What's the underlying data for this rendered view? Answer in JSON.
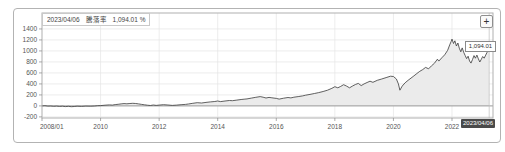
{
  "chart": {
    "tooltip": {
      "date": "2023/04/06",
      "metric_label": "騰落率",
      "value": "1,094.01 %"
    },
    "zoom_button_label": "+",
    "last_value_label": "1,094.01",
    "crosshair_date_label": "2023/04/06",
    "colors": {
      "line": "#3a3a3a",
      "area_fill": "#ebebeb",
      "grid": "#e4e4e4",
      "plot_border": "#b0b0b0",
      "zero_line": "#999999",
      "tick": "#888888",
      "axis_text": "#555555",
      "crosshair_line": "#c0c0c0",
      "crosshair_bg": "#4a4a4a"
    }
  },
  "chart_data": {
    "type": "area",
    "title": "",
    "xlabel": "",
    "ylabel": "",
    "legend": "none",
    "grid": "on",
    "xlim": [
      2008.0,
      2023.4
    ],
    "ylim": [
      -220,
      1690
    ],
    "x_ticks": [
      {
        "x": 2008.0,
        "label": "2008/01"
      },
      {
        "x": 2010,
        "label": "2010"
      },
      {
        "x": 2012,
        "label": "2012"
      },
      {
        "x": 2014,
        "label": "2014"
      },
      {
        "x": 2016,
        "label": "2016"
      },
      {
        "x": 2018,
        "label": "2018"
      },
      {
        "x": 2020,
        "label": "2020"
      },
      {
        "x": 2022,
        "label": "2022"
      }
    ],
    "y_ticks": [
      {
        "v": 1400,
        "label": "1400"
      },
      {
        "v": 1200,
        "label": "1200"
      },
      {
        "v": 1000,
        "label": "1000"
      },
      {
        "v": 800,
        "label": "800"
      },
      {
        "v": 600,
        "label": "600"
      },
      {
        "v": 400,
        "label": "400"
      },
      {
        "v": 200,
        "label": "200"
      },
      {
        "v": 0,
        "label": "0"
      },
      {
        "v": -200,
        "label": "-200"
      }
    ],
    "series": [
      {
        "name": "騰落率 (%)",
        "last_point": {
          "date": "2023/04/06",
          "value": 1094.01
        },
        "points": [
          [
            2008.0,
            0
          ],
          [
            2008.1,
            3
          ],
          [
            2008.2,
            -4
          ],
          [
            2008.3,
            -2
          ],
          [
            2008.4,
            -7
          ],
          [
            2008.5,
            -4
          ],
          [
            2008.6,
            -9
          ],
          [
            2008.7,
            -6
          ],
          [
            2008.8,
            -12
          ],
          [
            2008.9,
            -8
          ],
          [
            2009.0,
            -14
          ],
          [
            2009.1,
            -10
          ],
          [
            2009.2,
            -6
          ],
          [
            2009.35,
            -9
          ],
          [
            2009.5,
            -3
          ],
          [
            2009.65,
            -6
          ],
          [
            2009.8,
            -1
          ],
          [
            2009.9,
            3
          ],
          [
            2010.0,
            6
          ],
          [
            2010.15,
            12
          ],
          [
            2010.3,
            18
          ],
          [
            2010.4,
            14
          ],
          [
            2010.5,
            24
          ],
          [
            2010.6,
            30
          ],
          [
            2010.7,
            36
          ],
          [
            2010.8,
            42
          ],
          [
            2010.9,
            38
          ],
          [
            2011.0,
            44
          ],
          [
            2011.1,
            48
          ],
          [
            2011.2,
            43
          ],
          [
            2011.3,
            36
          ],
          [
            2011.4,
            28
          ],
          [
            2011.5,
            20
          ],
          [
            2011.6,
            12
          ],
          [
            2011.7,
            8
          ],
          [
            2011.8,
            16
          ],
          [
            2011.9,
            10
          ],
          [
            2012.0,
            14
          ],
          [
            2012.15,
            22
          ],
          [
            2012.3,
            16
          ],
          [
            2012.45,
            10
          ],
          [
            2012.6,
            15
          ],
          [
            2012.75,
            22
          ],
          [
            2012.9,
            28
          ],
          [
            2013.0,
            35
          ],
          [
            2013.15,
            48
          ],
          [
            2013.3,
            58
          ],
          [
            2013.45,
            52
          ],
          [
            2013.6,
            64
          ],
          [
            2013.75,
            72
          ],
          [
            2013.9,
            80
          ],
          [
            2014.0,
            90
          ],
          [
            2014.1,
            78
          ],
          [
            2014.25,
            90
          ],
          [
            2014.4,
            98
          ],
          [
            2014.5,
            94
          ],
          [
            2014.65,
            106
          ],
          [
            2014.8,
            116
          ],
          [
            2014.9,
            122
          ],
          [
            2015.0,
            128
          ],
          [
            2015.15,
            142
          ],
          [
            2015.3,
            156
          ],
          [
            2015.45,
            170
          ],
          [
            2015.55,
            158
          ],
          [
            2015.65,
            144
          ],
          [
            2015.75,
            154
          ],
          [
            2015.85,
            147
          ],
          [
            2016.0,
            136
          ],
          [
            2016.1,
            124
          ],
          [
            2016.25,
            140
          ],
          [
            2016.4,
            152
          ],
          [
            2016.5,
            146
          ],
          [
            2016.6,
            158
          ],
          [
            2016.75,
            170
          ],
          [
            2016.9,
            182
          ],
          [
            2017.0,
            194
          ],
          [
            2017.15,
            210
          ],
          [
            2017.3,
            225
          ],
          [
            2017.45,
            242
          ],
          [
            2017.6,
            262
          ],
          [
            2017.75,
            285
          ],
          [
            2017.9,
            320
          ],
          [
            2018.0,
            350
          ],
          [
            2018.1,
            330
          ],
          [
            2018.2,
            355
          ],
          [
            2018.3,
            385
          ],
          [
            2018.4,
            360
          ],
          [
            2018.5,
            330
          ],
          [
            2018.6,
            360
          ],
          [
            2018.7,
            390
          ],
          [
            2018.8,
            410
          ],
          [
            2018.9,
            370
          ],
          [
            2019.0,
            400
          ],
          [
            2019.1,
            425
          ],
          [
            2019.2,
            450
          ],
          [
            2019.3,
            430
          ],
          [
            2019.45,
            465
          ],
          [
            2019.6,
            490
          ],
          [
            2019.75,
            515
          ],
          [
            2019.9,
            540
          ],
          [
            2020.0,
            535
          ],
          [
            2020.1,
            490
          ],
          [
            2020.17,
            400
          ],
          [
            2020.22,
            285
          ],
          [
            2020.3,
            360
          ],
          [
            2020.4,
            420
          ],
          [
            2020.5,
            465
          ],
          [
            2020.6,
            505
          ],
          [
            2020.7,
            545
          ],
          [
            2020.8,
            590
          ],
          [
            2020.9,
            630
          ],
          [
            2021.0,
            660
          ],
          [
            2021.1,
            700
          ],
          [
            2021.2,
            675
          ],
          [
            2021.3,
            730
          ],
          [
            2021.4,
            775
          ],
          [
            2021.5,
            850
          ],
          [
            2021.55,
            815
          ],
          [
            2021.65,
            875
          ],
          [
            2021.75,
            930
          ],
          [
            2021.85,
            1010
          ],
          [
            2021.92,
            1110
          ],
          [
            2021.97,
            1170
          ],
          [
            2022.0,
            1215
          ],
          [
            2022.05,
            1135
          ],
          [
            2022.1,
            1185
          ],
          [
            2022.15,
            1090
          ],
          [
            2022.2,
            1145
          ],
          [
            2022.25,
            1050
          ],
          [
            2022.3,
            985
          ],
          [
            2022.35,
            1055
          ],
          [
            2022.4,
            975
          ],
          [
            2022.45,
            915
          ],
          [
            2022.5,
            860
          ],
          [
            2022.55,
            905
          ],
          [
            2022.6,
            815
          ],
          [
            2022.65,
            778
          ],
          [
            2022.7,
            845
          ],
          [
            2022.75,
            915
          ],
          [
            2022.8,
            868
          ],
          [
            2022.85,
            925
          ],
          [
            2022.9,
            855
          ],
          [
            2022.95,
            798
          ],
          [
            2023.0,
            848
          ],
          [
            2023.05,
            898
          ],
          [
            2023.1,
            868
          ],
          [
            2023.15,
            925
          ],
          [
            2023.2,
            975
          ],
          [
            2023.24,
            1020
          ],
          [
            2023.27,
            1094.01
          ]
        ]
      }
    ]
  }
}
